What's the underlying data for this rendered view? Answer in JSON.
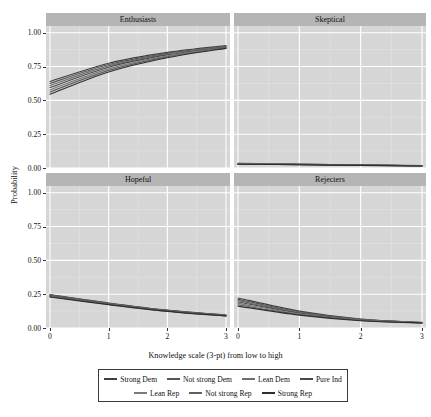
{
  "chart_data": {
    "type": "line",
    "title": "",
    "xlabel": "Knowledge scale (3-pt) from low to high",
    "ylabel": "Probability",
    "xlim": [
      0,
      3
    ],
    "ylim": [
      0,
      1.05
    ],
    "xticks": [
      0,
      1,
      2,
      3
    ],
    "xticklabels": [
      "0",
      "1",
      "2",
      "3"
    ],
    "yticks": [
      0.0,
      0.25,
      0.5,
      0.75,
      1.0
    ],
    "yticklabels": [
      "0.00",
      "0.25",
      "0.50",
      "0.75",
      "1.00"
    ],
    "grid": true,
    "legend_position": "bottom",
    "facet_titles": [
      "Enthusiasts",
      "Skeptical",
      "Hopeful",
      "Rejecters"
    ],
    "legend_entries": [
      {
        "name": "Strong Dem",
        "color": "#3f3f3f"
      },
      {
        "name": "Not strong Dem",
        "color": "#565656"
      },
      {
        "name": "Lean Dem",
        "color": "#6d6d6d"
      },
      {
        "name": "Pure Ind",
        "color": "#4a4a4a"
      },
      {
        "name": "Lean Rep",
        "color": "#7a7a7a"
      },
      {
        "name": "Not strong Rep",
        "color": "#5f5f5f"
      },
      {
        "name": "Strong Rep",
        "color": "#2e2e2e"
      }
    ],
    "x": [
      0,
      1,
      2,
      3
    ],
    "facets": [
      {
        "name": "Enthusiasts",
        "series": [
          {
            "name": "Strong Dem",
            "values": [
              0.64,
              0.775,
              0.855,
              0.905
            ]
          },
          {
            "name": "Not strong Dem",
            "values": [
              0.625,
              0.765,
              0.848,
              0.9
            ]
          },
          {
            "name": "Lean Dem",
            "values": [
              0.61,
              0.755,
              0.842,
              0.897
            ]
          },
          {
            "name": "Pure Ind",
            "values": [
              0.595,
              0.745,
              0.836,
              0.894
            ]
          },
          {
            "name": "Lean Rep",
            "values": [
              0.578,
              0.733,
              0.829,
              0.891
            ]
          },
          {
            "name": "Not strong Rep",
            "values": [
              0.562,
              0.722,
              0.822,
              0.888
            ]
          },
          {
            "name": "Strong Rep",
            "values": [
              0.545,
              0.71,
              0.815,
              0.885
            ]
          }
        ]
      },
      {
        "name": "Skeptical",
        "series": [
          {
            "name": "Strong Dem",
            "values": [
              0.034,
              0.029,
              0.023,
              0.018
            ]
          },
          {
            "name": "Not strong Dem",
            "values": [
              0.033,
              0.028,
              0.022,
              0.017
            ]
          },
          {
            "name": "Lean Dem",
            "values": [
              0.032,
              0.027,
              0.022,
              0.017
            ]
          },
          {
            "name": "Pure Ind",
            "values": [
              0.031,
              0.026,
              0.021,
              0.016
            ]
          },
          {
            "name": "Lean Rep",
            "values": [
              0.03,
              0.025,
              0.021,
              0.016
            ]
          },
          {
            "name": "Not strong Rep",
            "values": [
              0.029,
              0.025,
              0.02,
              0.015
            ]
          },
          {
            "name": "Strong Rep",
            "values": [
              0.028,
              0.024,
              0.019,
              0.015
            ]
          }
        ]
      },
      {
        "name": "Hopeful",
        "series": [
          {
            "name": "Strong Dem",
            "values": [
              0.247,
              0.185,
              0.132,
              0.096
            ]
          },
          {
            "name": "Not strong Dem",
            "values": [
              0.244,
              0.183,
              0.13,
              0.094
            ]
          },
          {
            "name": "Lean Dem",
            "values": [
              0.241,
              0.181,
              0.129,
              0.093
            ]
          },
          {
            "name": "Pure Ind",
            "values": [
              0.238,
              0.179,
              0.127,
              0.092
            ]
          },
          {
            "name": "Lean Rep",
            "values": [
              0.235,
              0.177,
              0.126,
              0.091
            ]
          },
          {
            "name": "Not strong Rep",
            "values": [
              0.232,
              0.175,
              0.124,
              0.09
            ]
          },
          {
            "name": "Strong Rep",
            "values": [
              0.229,
              0.173,
              0.123,
              0.089
            ]
          }
        ]
      },
      {
        "name": "Rejecters",
        "series": [
          {
            "name": "Strong Dem",
            "values": [
              0.222,
              0.125,
              0.066,
              0.042
            ]
          },
          {
            "name": "Not strong Dem",
            "values": [
              0.212,
              0.12,
              0.064,
              0.041
            ]
          },
          {
            "name": "Lean Dem",
            "values": [
              0.202,
              0.115,
              0.062,
              0.04
            ]
          },
          {
            "name": "Pure Ind",
            "values": [
              0.192,
              0.11,
              0.06,
              0.039
            ]
          },
          {
            "name": "Lean Rep",
            "values": [
              0.182,
              0.105,
              0.058,
              0.038
            ]
          },
          {
            "name": "Not strong Rep",
            "values": [
              0.172,
              0.1,
              0.056,
              0.038
            ]
          },
          {
            "name": "Strong Rep",
            "values": [
              0.162,
              0.095,
              0.054,
              0.037
            ]
          }
        ]
      }
    ]
  },
  "axis": {
    "ylabel": "Probability",
    "xlabel": "Knowledge scale (3-pt) from low to high"
  }
}
